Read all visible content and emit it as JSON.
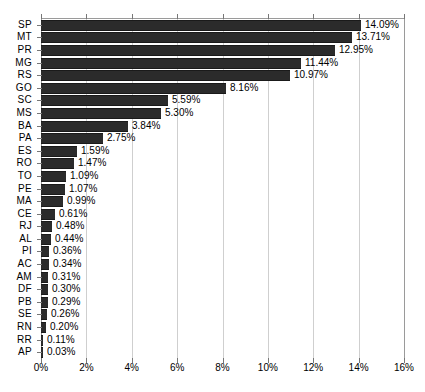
{
  "chart_data": {
    "type": "bar",
    "orientation": "horizontal",
    "title": "",
    "subtitle": "",
    "xlabel": "",
    "ylabel": "",
    "xlim": [
      0,
      16
    ],
    "xtick_labels": [
      "0%",
      "2%",
      "4%",
      "6%",
      "8%",
      "10%",
      "12%",
      "14%",
      "16%"
    ],
    "xticks": [
      0,
      2,
      4,
      6,
      8,
      10,
      12,
      14,
      16
    ],
    "grid": true,
    "grid_axis": "x",
    "legend": false,
    "legend_position": "none",
    "value_suffix": "%",
    "categories": [
      "SP",
      "MT",
      "PR",
      "MG",
      "RS",
      "GO",
      "SC",
      "MS",
      "BA",
      "PA",
      "ES",
      "RO",
      "TO",
      "PE",
      "MA",
      "CE",
      "RJ",
      "AL",
      "PI",
      "AC",
      "AM",
      "DF",
      "PB",
      "SE",
      "RN",
      "RR",
      "AP"
    ],
    "values": [
      14.09,
      13.71,
      12.95,
      11.44,
      10.97,
      8.16,
      5.59,
      5.3,
      3.84,
      2.75,
      1.59,
      1.47,
      1.09,
      1.07,
      0.99,
      0.61,
      0.48,
      0.44,
      0.36,
      0.34,
      0.31,
      0.3,
      0.29,
      0.26,
      0.2,
      0.11,
      0.03
    ],
    "value_labels": [
      "14.09%",
      "13.71%",
      "12.95%",
      "11.44%",
      "10.97%",
      "8.16%",
      "5.59%",
      "5.30%",
      "3.84%",
      "2.75%",
      "1.59%",
      "1.47%",
      "1.09%",
      "1.07%",
      "0.99%",
      "0.61%",
      "0.48%",
      "0.44%",
      "0.36%",
      "0.34%",
      "0.31%",
      "0.30%",
      "0.29%",
      "0.26%",
      "0.20%",
      "0.11%",
      "0.03%"
    ],
    "colors": {
      "bar": "#2b2b2b",
      "bar_edge": "#1a1a1a",
      "gridline": "#cfcfcf",
      "axis": "#9a9a9a",
      "tick": "#777777",
      "text": "#000000",
      "background": "#ffffff"
    }
  }
}
